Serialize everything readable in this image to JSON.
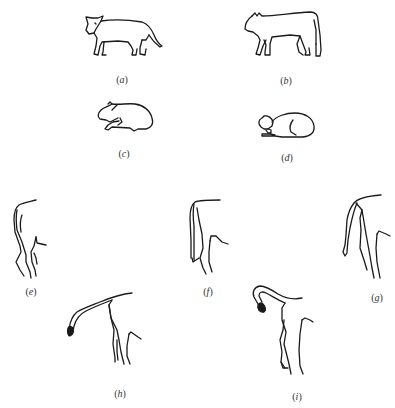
{
  "figure": {
    "panels": [
      {
        "id": "a",
        "label": "a",
        "description": "cat standing, tail lowered",
        "label_pos": [
          122,
          74
        ]
      },
      {
        "id": "b",
        "label": "b",
        "description": "cat standing, arched back, tail down",
        "label_pos": [
          286,
          75
        ]
      },
      {
        "id": "c",
        "label": "c",
        "description": "cat crouching",
        "label_pos": [
          124,
          148
        ]
      },
      {
        "id": "d",
        "label": "d",
        "description": "cat lying down",
        "label_pos": [
          287,
          152
        ]
      },
      {
        "id": "e",
        "label": "e",
        "description": "tail hanging down",
        "label_pos": [
          31,
          286
        ]
      },
      {
        "id": "f",
        "label": "f",
        "description": "tail held down close to hind legs",
        "label_pos": [
          208,
          286
        ]
      },
      {
        "id": "g",
        "label": "g",
        "description": "tail lowered, tip curved",
        "label_pos": [
          377,
          292
        ]
      },
      {
        "id": "h",
        "label": "h",
        "description": "tail raised horizontally, tip drooping",
        "label_pos": [
          120,
          388
        ]
      },
      {
        "id": "i",
        "label": "i",
        "description": "tail raised and curled over",
        "label_pos": [
          297,
          391
        ]
      }
    ],
    "colors": {
      "ink": "#1a1a1a",
      "label": "#333333",
      "background": "#ffffff"
    }
  }
}
